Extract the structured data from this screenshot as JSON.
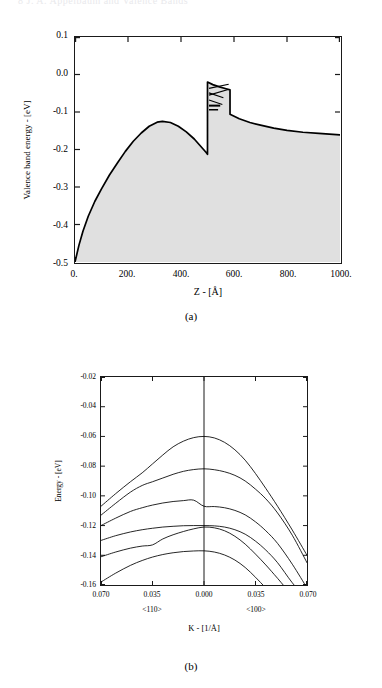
{
  "running_header": "8   J. A. Appelbaum and   Valence Bands",
  "figures": [
    {
      "id": "a",
      "caption": "(a)",
      "xlabel": "Z - [Å]",
      "ylabel": "Valence band energy - [eV]",
      "xticks": [
        "0.",
        "200.",
        "400.",
        "600.",
        "800.",
        "1000."
      ],
      "yticks": [
        "0.1",
        "0.0",
        "-0.1",
        "-0.2",
        "-0.3",
        "-0.4",
        "-0.5"
      ],
      "chart_data": {
        "type": "line",
        "title": "",
        "xlabel": "Z - [Å]",
        "ylabel": "Valence band energy - [eV]",
        "xlim": [
          0,
          1000
        ],
        "ylim": [
          -0.5,
          0.1
        ],
        "grid": false,
        "legend": "none",
        "fill": "shaded-below-curve",
        "fill_color": "#e0e0e0",
        "line_color": "#000000",
        "annotations": [
          {
            "name": "quantum-well-barrier",
            "x": 500,
            "note": "abrupt step in potential"
          },
          {
            "name": "confined-level-1",
            "x_range": [
              500,
              585
            ],
            "energy": -0.047
          },
          {
            "name": "confined-level-2",
            "x_range": [
              500,
              585
            ],
            "energy": -0.064
          },
          {
            "name": "confined-level-3",
            "x_range": [
              500,
              560
            ],
            "energy": -0.085
          },
          {
            "name": "confined-level-4",
            "x_range": [
              505,
              550
            ],
            "energy": -0.095
          }
        ],
        "series": [
          {
            "name": "valence band edge profile",
            "x": [
              0,
              15,
              30,
              50,
              75,
              100,
              130,
              160,
              190,
              220,
              250,
              280,
              310,
              330,
              360,
              390,
              420,
              450,
              475,
              495,
              500,
              500,
              520,
              545,
              570,
              585,
              585,
              620,
              660,
              700,
              750,
              800,
              860,
              920,
              1000
            ],
            "y": [
              -0.5,
              -0.455,
              -0.418,
              -0.378,
              -0.338,
              -0.305,
              -0.268,
              -0.236,
              -0.205,
              -0.178,
              -0.156,
              -0.138,
              -0.127,
              -0.125,
              -0.128,
              -0.138,
              -0.153,
              -0.172,
              -0.192,
              -0.208,
              -0.213,
              -0.02,
              -0.027,
              -0.033,
              -0.038,
              -0.041,
              -0.106,
              -0.118,
              -0.128,
              -0.135,
              -0.143,
              -0.149,
              -0.154,
              -0.157,
              -0.161
            ]
          }
        ]
      }
    },
    {
      "id": "b",
      "caption": "(b)",
      "xlabel": "K - [1/Å]",
      "ylabel": "Energy - [eV]",
      "xticks": [
        "0.070",
        "0.035",
        "0.000",
        "0.035",
        "0.070"
      ],
      "yticks": [
        "-0.02",
        "-0.04",
        "-0.06",
        "-0.08",
        "-0.10",
        "-0.12",
        "-0.14",
        "-0.16"
      ],
      "direction_left": "<110>",
      "direction_right": "<100>",
      "chart_data": {
        "type": "line",
        "title": "",
        "xlabel": "K - [1/Å]",
        "ylabel": "Energy - [eV]",
        "xlim": [
          -0.07,
          0.07
        ],
        "ylim": [
          -0.16,
          -0.02
        ],
        "grid": false,
        "legend": "none",
        "line_color": "#000000",
        "x_axis_note": "left half is <110> direction, right half is <100> direction; centre is K=0.000",
        "center_line": true,
        "series": [
          {
            "name": "subband 1 (HH1)",
            "x": [
              -0.07,
              -0.06,
              -0.05,
              -0.042,
              -0.035,
              -0.028,
              -0.021,
              -0.014,
              -0.007,
              0.0,
              0.007,
              0.014,
              0.021,
              0.028,
              0.035,
              0.042,
              0.05,
              0.06,
              0.07
            ],
            "y": [
              -0.107,
              -0.0985,
              -0.0905,
              -0.0845,
              -0.0785,
              -0.0725,
              -0.067,
              -0.0632,
              -0.0608,
              -0.06,
              -0.061,
              -0.064,
              -0.069,
              -0.076,
              -0.085,
              -0.095,
              -0.107,
              -0.123,
              -0.14
            ]
          },
          {
            "name": "subband 2 (LH1)",
            "x": [
              -0.07,
              -0.06,
              -0.05,
              -0.042,
              -0.035,
              -0.028,
              -0.021,
              -0.014,
              -0.007,
              0.0,
              0.007,
              0.014,
              0.021,
              0.028,
              0.035,
              0.042,
              0.05,
              0.06,
              0.07
            ],
            "y": [
              -0.113,
              -0.105,
              -0.0975,
              -0.093,
              -0.0905,
              -0.088,
              -0.0855,
              -0.0835,
              -0.0823,
              -0.0818,
              -0.0824,
              -0.0838,
              -0.0862,
              -0.09,
              -0.0955,
              -0.102,
              -0.1115,
              -0.1265,
              -0.145
            ]
          },
          {
            "name": "subband 3 (HH2)",
            "x": [
              -0.07,
              -0.06,
              -0.05,
              -0.042,
              -0.035,
              -0.028,
              -0.021,
              -0.014,
              -0.007,
              0.0,
              0.007,
              0.014,
              0.021,
              0.028,
              0.035,
              0.042,
              0.05,
              0.06,
              0.07
            ],
            "y": [
              -0.12,
              -0.115,
              -0.1105,
              -0.108,
              -0.1062,
              -0.1048,
              -0.1038,
              -0.1032,
              -0.1029,
              -0.107,
              -0.1072,
              -0.108,
              -0.1098,
              -0.1128,
              -0.1175,
              -0.1235,
              -0.132,
              -0.146,
              -0.162
            ]
          },
          {
            "name": "subband 4 (LH2)",
            "x": [
              -0.07,
              -0.06,
              -0.05,
              -0.042,
              -0.035,
              -0.028,
              -0.021,
              -0.014,
              -0.007,
              0.0,
              0.007,
              0.014,
              0.021,
              0.028,
              0.035,
              0.042,
              0.05,
              0.06,
              0.07
            ],
            "y": [
              -0.13,
              -0.1268,
              -0.1243,
              -0.1228,
              -0.1218,
              -0.121,
              -0.1205,
              -0.1201,
              -0.12,
              -0.12,
              -0.1202,
              -0.121,
              -0.1228,
              -0.1258,
              -0.1305,
              -0.1365,
              -0.145,
              -0.1585,
              -0.17
            ]
          },
          {
            "name": "subband 5 (HH3)",
            "x": [
              -0.07,
              -0.06,
              -0.05,
              -0.042,
              -0.035,
              -0.028,
              -0.021,
              -0.014,
              -0.007,
              0.0,
              0.007,
              0.014,
              0.021,
              0.028,
              0.035,
              0.042,
              0.05,
              0.06,
              0.07
            ],
            "y": [
              -0.141,
              -0.1378,
              -0.1352,
              -0.1338,
              -0.133,
              -0.129,
              -0.1262,
              -0.124,
              -0.1222,
              -0.121,
              -0.1215,
              -0.1235,
              -0.1272,
              -0.1325,
              -0.1392,
              -0.1465,
              -0.1555,
              -0.167,
              -0.176
            ]
          },
          {
            "name": "subband 6",
            "x": [
              -0.07,
              -0.06,
              -0.05,
              -0.042,
              -0.035,
              -0.028,
              -0.021,
              -0.014,
              -0.007,
              0.0,
              0.007,
              0.014,
              0.021,
              0.028,
              0.035,
              0.042,
              0.05,
              0.06,
              0.07
            ],
            "y": [
              -0.158,
              -0.152,
              -0.1468,
              -0.1435,
              -0.1412,
              -0.1395,
              -0.1383,
              -0.1375,
              -0.1371,
              -0.137,
              -0.1378,
              -0.1398,
              -0.1432,
              -0.1482,
              -0.1548,
              -0.162,
              -0.17,
              -0.179,
              -0.186
            ]
          }
        ]
      }
    }
  ]
}
